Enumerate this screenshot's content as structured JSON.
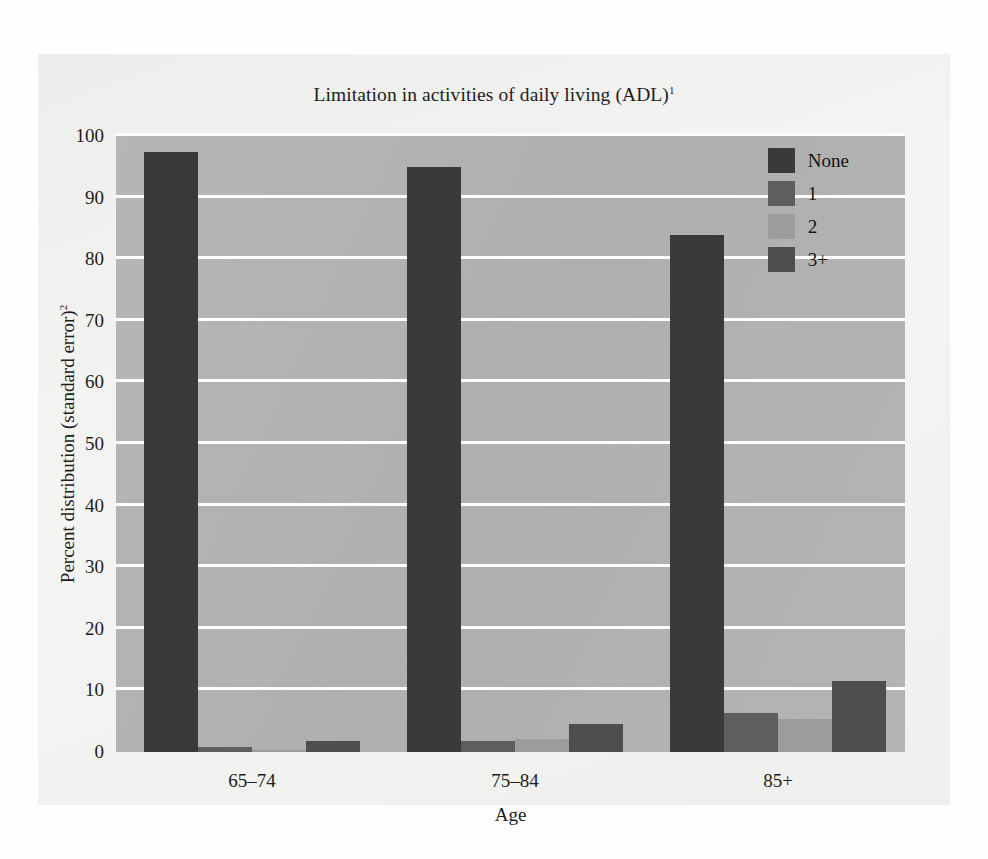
{
  "chart_data": {
    "type": "bar",
    "title": "Limitation in activities of daily living (ADL)",
    "title_superscript": "1",
    "subtitle": "",
    "xlabel": "Age",
    "ylabel": "Percent distribution (standard error)",
    "ylabel_superscript": "2",
    "categories": [
      "65–74",
      "75–84",
      "85+"
    ],
    "ylim": [
      0,
      100
    ],
    "yticks": [
      0,
      10,
      20,
      30,
      40,
      50,
      60,
      70,
      80,
      90,
      100
    ],
    "ytick_labels": [
      "0",
      "10",
      "20",
      "30",
      "40",
      "50",
      "60",
      "70",
      "80",
      "90",
      "100"
    ],
    "grid": true,
    "grid_color": "#fdfdfd",
    "plot_background": "#b2b2b2",
    "legend_position": "top-right",
    "grouping": "grouped",
    "series": [
      {
        "name": "None",
        "color": "#3a3a3a",
        "values": [
          97.4,
          95.0,
          84.0
        ]
      },
      {
        "name": "1",
        "color": "#5e5e5e",
        "values": [
          0.8,
          1.8,
          6.3
        ]
      },
      {
        "name": "2",
        "color": "#9c9c9c",
        "values": [
          0.4,
          2.1,
          5.3
        ]
      },
      {
        "name": "3+",
        "color": "#4e4e4e",
        "values": [
          1.8,
          4.5,
          11.6
        ]
      }
    ]
  },
  "legend": {
    "items": [
      {
        "label": "None",
        "color": "#3a3a3a"
      },
      {
        "label": "1",
        "color": "#5e5e5e"
      },
      {
        "label": "2",
        "color": "#9c9c9c"
      },
      {
        "label": "3+",
        "color": "#4e4e4e"
      }
    ]
  }
}
